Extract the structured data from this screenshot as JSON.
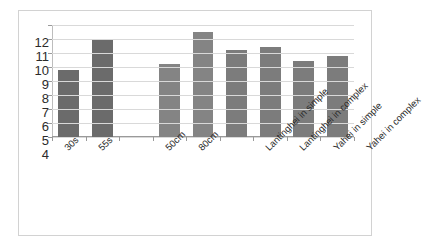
{
  "chart_data": {
    "type": "bar",
    "title": "",
    "subtitle": "",
    "xlabel": "",
    "ylabel": "",
    "ylim": [
      4,
      12
    ],
    "ytick_labels": [
      "12",
      "11",
      "10",
      "9",
      "8",
      "7",
      "6",
      "5",
      "4"
    ],
    "ytick_values": [
      12,
      11,
      10,
      9,
      8,
      7,
      6,
      5,
      4
    ],
    "grid": true,
    "legend": "none",
    "slot_count": 9,
    "categories": [
      "30s",
      "55s",
      "",
      "50cm",
      "80cm",
      "",
      "Lantinghei in simple",
      "Lantinghei in complex",
      "Yahei in simple",
      "Yahei in complex"
    ],
    "bars": [
      {
        "slot": 0,
        "label": "30s",
        "value": 8.8,
        "color": "#6b6b6b"
      },
      {
        "slot": 1,
        "label": "55s",
        "value": 11.0,
        "color": "#6b6b6b"
      },
      {
        "slot": 3,
        "label": "50cm",
        "value": 9.2,
        "color": "#848484"
      },
      {
        "slot": 4,
        "label": "80cm",
        "value": 11.5,
        "color": "#848484"
      },
      {
        "slot": 5,
        "label": "Lantinghei in simple",
        "value": 10.2,
        "color": "#7c7c7c"
      },
      {
        "slot": 6,
        "label": "Lantinghei in complex",
        "value": 10.4,
        "color": "#7c7c7c"
      },
      {
        "slot": 7,
        "label": "Yahei in simple",
        "value": 9.4,
        "color": "#7c7c7c"
      },
      {
        "slot": 8,
        "label": "Yahei in complex",
        "value": 9.8,
        "color": "#7c7c7c"
      }
    ],
    "tick_labels_rotated": true,
    "tick_label_rotation_deg": -45,
    "colors": {
      "gridline": "#d9d9d9",
      "axis": "#9a9a9a",
      "frame_border": "#d2d2d2",
      "background": "#ffffff",
      "tick_text": "#2b2b2b"
    }
  }
}
